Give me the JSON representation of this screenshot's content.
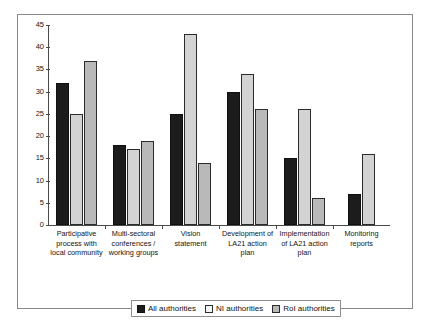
{
  "chart_data": {
    "type": "bar",
    "title": "",
    "subtitle": "",
    "xlabel": "",
    "ylabel": "",
    "ylim": [
      0,
      45
    ],
    "yticks": [
      0,
      5,
      10,
      15,
      20,
      25,
      30,
      35,
      40,
      45
    ],
    "grid": false,
    "legend_position": "bottom",
    "categories": [
      "Participative process with local community",
      "Multi-sectoral conferences / working groups",
      "Vision statement",
      "Development of LA21 action plan",
      "Implementation of LA21 action plan",
      "Monitoring reports"
    ],
    "category_label_lines": [
      [
        "Participative",
        "process with",
        "local community"
      ],
      [
        "Multi-sectoral",
        "conferences /",
        "working groups"
      ],
      [
        "Vision",
        "statement"
      ],
      [
        "Development of",
        "LA21 action",
        "plan"
      ],
      [
        "Implementation",
        "of LA21 action",
        "plan"
      ],
      [
        "Monitoring",
        "reports"
      ]
    ],
    "series": [
      {
        "name": "All authorities",
        "color": "#1c1c1c",
        "values": [
          32,
          18,
          25,
          30,
          15,
          7
        ]
      },
      {
        "name": "NI authorities",
        "color": "#d3d3d3",
        "values": [
          25,
          17,
          43,
          34,
          26,
          16
        ]
      },
      {
        "name": "RoI authorities",
        "color": "#b9b9b9",
        "values": [
          37,
          19,
          14,
          26,
          6,
          null
        ]
      }
    ]
  },
  "legend": {
    "items": [
      {
        "label": "All authorities",
        "swatch": "s-all"
      },
      {
        "label": "NI authorities",
        "swatch": "s-ni"
      },
      {
        "label": "RoI authorities",
        "swatch": "s-roi"
      }
    ]
  }
}
